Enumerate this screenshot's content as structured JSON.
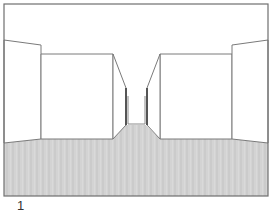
{
  "figure": {
    "label": "1",
    "colors": {
      "background": "#ffffff",
      "line": "#777777",
      "floor": "#d2d2d2",
      "floor_dark": "#bcbcbc",
      "wall": "#ffffff",
      "inner_wall_shade": "#9a9a9a"
    }
  }
}
